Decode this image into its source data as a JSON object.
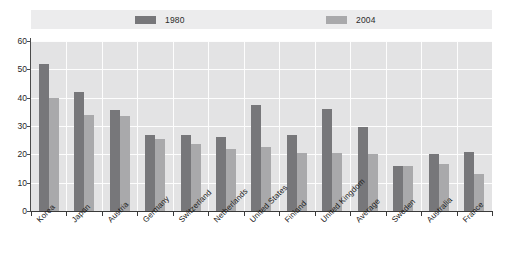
{
  "chart_data": {
    "type": "bar",
    "title": "",
    "xlabel": "",
    "ylabel": "",
    "ylim": [
      0,
      60
    ],
    "yticks": [
      0,
      10,
      20,
      30,
      40,
      50,
      60
    ],
    "grid": true,
    "legend_position": "top",
    "categories": [
      "Korea",
      "Japan",
      "Austria",
      "Germany",
      "Switzerland",
      "Netherlands",
      "United States",
      "Finland",
      "United Kingdom",
      "Average",
      "Sweden",
      "Australia",
      "France"
    ],
    "series": [
      {
        "name": "1980",
        "color": "#77777a",
        "values": [
          52,
          42,
          35.5,
          27,
          27,
          26,
          37.5,
          27,
          36,
          29.5,
          16,
          20,
          21
        ]
      },
      {
        "name": "2004",
        "color": "#a9a9ab",
        "values": [
          40,
          34,
          33.5,
          25.5,
          23.5,
          22,
          22.5,
          20.5,
          20.5,
          20,
          16,
          16.5,
          13
        ]
      }
    ]
  },
  "legend": {
    "entries": [
      {
        "label": "1980",
        "color": "#77777a"
      },
      {
        "label": "2004",
        "color": "#a9a9ab"
      }
    ]
  },
  "axis": {
    "y_tick_labels": [
      "0",
      "10",
      "20",
      "30",
      "40",
      "50",
      "60"
    ]
  },
  "colors": {
    "plot_background": "#e3e3e4",
    "legend_background": "#ececed",
    "gridline": "#fdfdfd",
    "axis": "#3a3a3a",
    "series_1980": "#77777a",
    "series_2004": "#a9a9ab"
  }
}
